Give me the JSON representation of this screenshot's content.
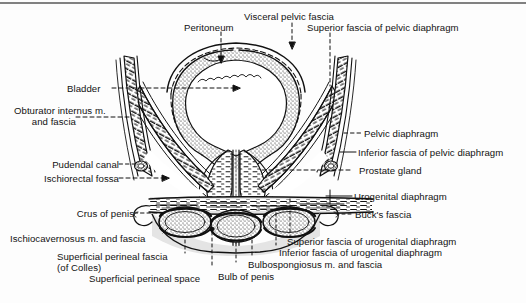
{
  "figure": {
    "title_visible": false,
    "ink_color": "#111111",
    "background_color": "#fdfdfd",
    "shade_color": "#d9d9d9"
  },
  "labels": {
    "peritoneum": "Peritoneum",
    "visceral_pelvic_fascia": "Visceral pelvic fascia",
    "superior_fascia_pelvic_diaphragm": "Superior fascia of pelvic diaphragm",
    "bladder": "Bladder",
    "obturator_internus_line1": "Obturator internus m.",
    "obturator_internus_line2": "and fascia",
    "pudendal_canal": "Pudendal canal",
    "ischiorectal_fossa": "Ischiorectal fossa",
    "crus_of_penis": "Crus of penis",
    "ischiocavernosus": "Ischiocavernosus m. and fascia",
    "superficial_perineal_fascia_line1": "Superficial perineal fascia",
    "superficial_perineal_fascia_line2": "(of Colles)",
    "superficial_perineal_space": "Superficial perineal space",
    "pelvic_diaphragm": "Pelvic diaphragm",
    "inferior_fascia_pelvic_diaphragm": "Inferior fascia of pelvic diaphragm",
    "prostate_gland": "Prostate gland",
    "urogenital_diaphragm": "Urogenital diaphragm",
    "bucks_fascia": "Buck's fascia",
    "superior_fascia_urogenital_diaphragm": "Superior fascia of urogenital diaphragm",
    "inferior_fascia_urogenital_diaphragm": "Inferior fascia of urogenital diaphragm",
    "bulbospongiosus": "Bulbospongiosus m. and fascia",
    "bulb_of_penis": "Bulb of penis"
  }
}
